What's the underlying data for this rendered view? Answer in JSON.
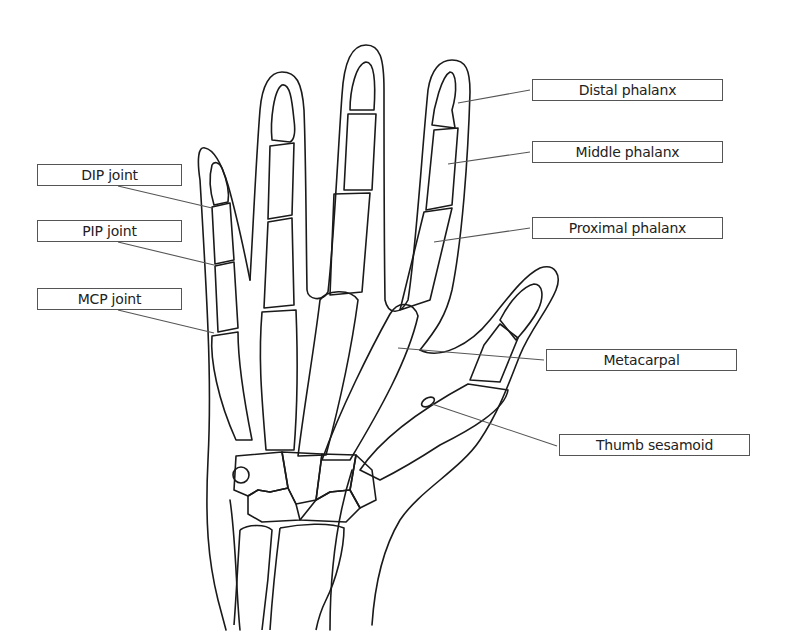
{
  "diagram": {
    "labels": {
      "distal_phalanx": "Distal phalanx",
      "middle_phalanx": "Middle phalanx",
      "proximal_phalanx": "Proximal phalanx",
      "metacarpal": "Metacarpal",
      "thumb_sesamoid": "Thumb sesamoid",
      "dip_joint": "DIP joint",
      "pip_joint": "PIP joint",
      "mcp_joint": "MCP joint"
    },
    "colors": {
      "line": "#1a1a1a",
      "leader": "#555555",
      "box_border": "#555555",
      "background": "#ffffff"
    }
  }
}
